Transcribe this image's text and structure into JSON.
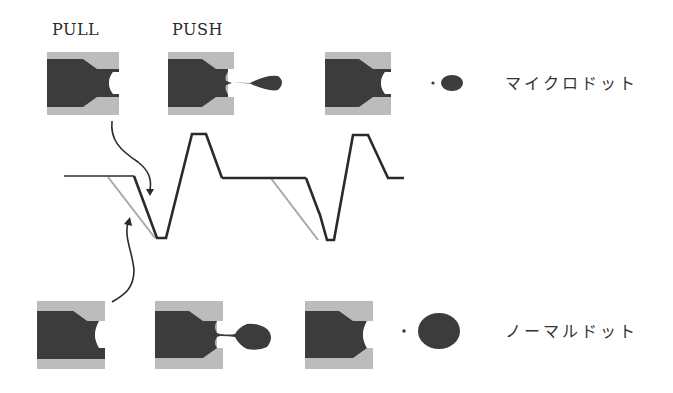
{
  "labels": {
    "pull": "PULL",
    "push": "PUSH",
    "micro_dot": "マイクロドット",
    "normal_dot": "ノーマルドット"
  },
  "colors": {
    "nozzle_wall": "#bcbcbc",
    "ink": "#3c3c3c",
    "waveform_black": "#2a2a2a",
    "waveform_gray": "#a8a8a8",
    "background": "#ffffff"
  },
  "rows": [
    {
      "name": "micro-dot-sequence",
      "stages": [
        "pull-meniscus",
        "push-ejection-small-droplet",
        "meniscus-after-ejection"
      ],
      "result_label_key": "micro_dot"
    },
    {
      "name": "normal-dot-sequence",
      "stages": [
        "pull-meniscus",
        "push-ejection-large-droplet",
        "meniscus-after-ejection"
      ],
      "result_label_key": "normal_dot"
    }
  ]
}
